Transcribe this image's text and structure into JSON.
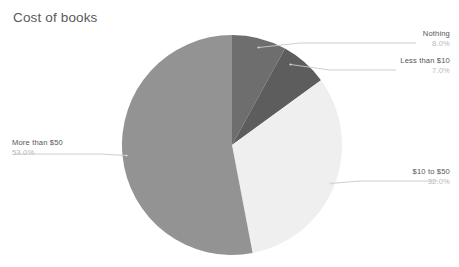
{
  "chart": {
    "title": "Cost of books"
  },
  "chart_data": {
    "type": "pie",
    "title": "Cost of books",
    "xlabel": "",
    "ylabel": "",
    "categories": [
      "Nothing",
      "Less than $10",
      "$10 to $50",
      "More than $50"
    ],
    "values": [
      8.0,
      7.0,
      32.0,
      53.0
    ],
    "value_labels": [
      "8.0%",
      "7.0%",
      "32.0%",
      "53.0%"
    ],
    "units": "percent",
    "total": 100.0,
    "start_angle_deg": 0,
    "direction": "clockwise",
    "legend": "none",
    "grid": false,
    "slice_colors": [
      "#6e6e6e",
      "#5d5d5d",
      "#efefef",
      "#939393"
    ],
    "slices": [
      {
        "label": "Nothing",
        "value": 8.0,
        "value_label": "8.0%",
        "color": "#6e6e6e"
      },
      {
        "label": "Less than $10",
        "value": 7.0,
        "value_label": "7.0%",
        "color": "#5d5d5d"
      },
      {
        "label": "$10 to $50",
        "value": 32.0,
        "value_label": "32.0%",
        "color": "#efefef"
      },
      {
        "label": "More than $50",
        "value": 53.0,
        "value_label": "53.0%",
        "color": "#939393"
      }
    ]
  },
  "colors": {
    "title_text": "#5a5a5a",
    "label_text": "#555555",
    "percent_text": "#b9b9b9",
    "leader_line": "#c8c8c8",
    "background": "#ffffff"
  }
}
